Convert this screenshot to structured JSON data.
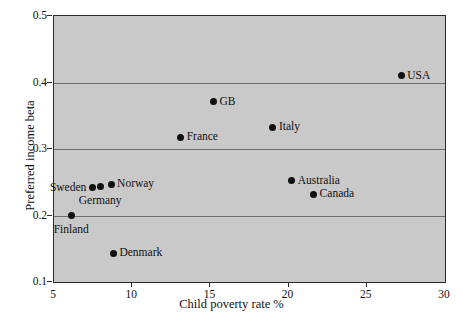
{
  "chart_data": {
    "type": "scatter",
    "title": "",
    "xlabel": "Child poverty rate %",
    "ylabel": "Preferred income beta",
    "xlim": [
      5,
      30
    ],
    "ylim": [
      0.1,
      0.5
    ],
    "xticks": [
      "5",
      "10",
      "15",
      "20",
      "25",
      "30"
    ],
    "xtick_values": [
      5,
      10,
      15,
      20,
      25,
      30
    ],
    "yticks": [
      "0.1",
      "0.2",
      "0.3",
      "0.4",
      "0.5"
    ],
    "ytick_values": [
      0.1,
      0.2,
      0.3,
      0.4,
      0.5
    ],
    "grid": "horizontal",
    "gridlines_y": [
      0.2,
      0.3,
      0.4
    ],
    "legend": "none",
    "plot_background": "#c9c9c9",
    "marker_color": "#111111",
    "points": [
      {
        "label": "USA",
        "x": 27.2,
        "y": 0.41,
        "label_pos": "right"
      },
      {
        "label": "GB",
        "x": 15.2,
        "y": 0.371,
        "label_pos": "right"
      },
      {
        "label": "Italy",
        "x": 19.0,
        "y": 0.333,
        "label_pos": "right"
      },
      {
        "label": "France",
        "x": 13.1,
        "y": 0.318,
        "label_pos": "right"
      },
      {
        "label": "Australia",
        "x": 20.2,
        "y": 0.252,
        "label_pos": "right"
      },
      {
        "label": "Norway",
        "x": 8.65,
        "y": 0.247,
        "label_pos": "right"
      },
      {
        "label": "Germany",
        "x": 7.95,
        "y": 0.243,
        "label_pos": "below"
      },
      {
        "label": "Sweden",
        "x": 7.45,
        "y": 0.242,
        "label_pos": "left"
      },
      {
        "label": "Canada",
        "x": 21.6,
        "y": 0.232,
        "label_pos": "right"
      },
      {
        "label": "Finland",
        "x": 6.1,
        "y": 0.2,
        "label_pos": "below"
      },
      {
        "label": "Denmark",
        "x": 8.8,
        "y": 0.143,
        "label_pos": "right"
      }
    ]
  }
}
